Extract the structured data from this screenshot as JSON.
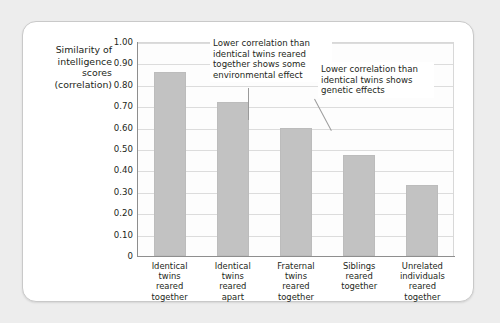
{
  "chart_data": {
    "type": "bar",
    "title": "",
    "xlabel": "",
    "ylabel": "Similarity of intelligence scores (correlation)",
    "ylabel_lines": [
      "Similarity of",
      "intelligence",
      "scores",
      "(correlation)"
    ],
    "categories": [
      "Identical twins reared together",
      "Identical twins reared apart",
      "Fraternal twins reared together",
      "Siblings reared together",
      "Unrelated individuals reared together"
    ],
    "category_lines": [
      [
        "Identical",
        "twins",
        "reared",
        "together"
      ],
      [
        "Identical",
        "twins",
        "reared",
        "apart"
      ],
      [
        "Fraternal",
        "twins",
        "reared",
        "together"
      ],
      [
        "Siblings",
        "reared",
        "together"
      ],
      [
        "Unrelated",
        "individuals",
        "reared",
        "together"
      ]
    ],
    "values": [
      0.86,
      0.72,
      0.6,
      0.47,
      0.33
    ],
    "ylim": [
      0,
      1.0
    ],
    "ytick_values": [
      1.0,
      0.9,
      0.8,
      0.7,
      0.6,
      0.5,
      0.4,
      0.3,
      0.2,
      0.1,
      0
    ],
    "ytick_labels": [
      "1.00",
      "0.90",
      "0.80",
      "0.70",
      "0.60",
      "0.50",
      "0.40",
      "0.30",
      "0.20",
      "0.10",
      "0"
    ],
    "grid": true,
    "legend": false,
    "bar_color": "#c2c2c2",
    "annotations": [
      {
        "text": "Lower correlation than identical twins reared together shows some environmental effect",
        "lines": [
          "Lower correlation than",
          "identical twins reared",
          "together shows some",
          "environmental effect"
        ],
        "points_to_category": "Identical twins reared apart"
      },
      {
        "text": "Lower correlation than identical twins shows genetic effects",
        "lines": [
          "Lower correlation than",
          "identical twins shows",
          "genetic effects"
        ],
        "points_to_category": "Fraternal twins reared together"
      }
    ]
  },
  "colors": {
    "page_background": "#ededed",
    "card_background": "#ffffff",
    "card_border": "#c9c9c9",
    "bar_fill": "#c2c2c2",
    "gridline": "#dcdcdc",
    "axis": "#8e8e8e",
    "text": "#231f20"
  }
}
